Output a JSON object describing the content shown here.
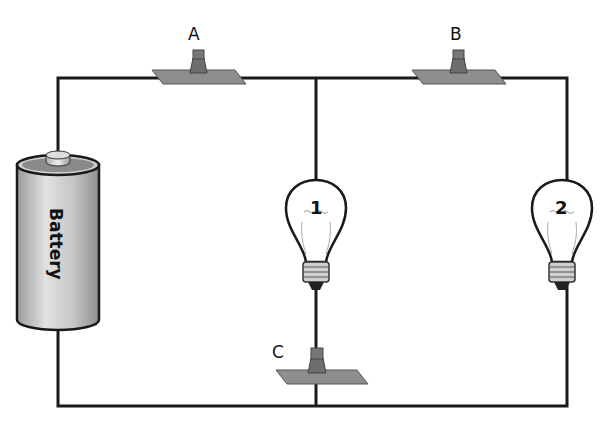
{
  "diagram": {
    "type": "electric circuit",
    "battery": {
      "label": "Battery"
    },
    "switches": [
      {
        "id": "A",
        "label": "A"
      },
      {
        "id": "B",
        "label": "B"
      },
      {
        "id": "C",
        "label": "C"
      }
    ],
    "bulbs": [
      {
        "id": "1",
        "label": "1"
      },
      {
        "id": "2",
        "label": "2"
      }
    ],
    "colors": {
      "wire": "#1a1a1a",
      "switch_base": "#8a8a8a",
      "battery_body": "#c8c8c8"
    }
  }
}
